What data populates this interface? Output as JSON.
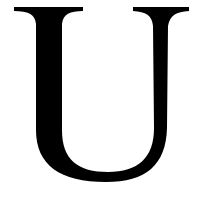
{
  "glyph": {
    "character": "U",
    "color": "#000000",
    "background": "#ffffff"
  }
}
